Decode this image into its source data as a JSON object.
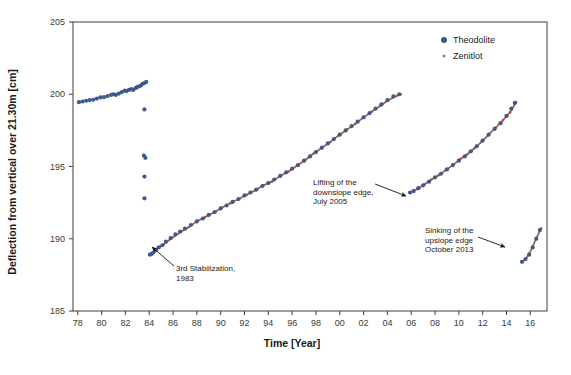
{
  "figure": {
    "background": "#ffffff",
    "frame_color": "#3f3f3f"
  },
  "chart_data": {
    "type": "scatter",
    "title": "",
    "xlabel": "Time [Year]",
    "ylabel": "Deflection from vertical over 21.30m [cm]",
    "xlim": [
      78,
      17
    ],
    "ylim": [
      185,
      205
    ],
    "grid": false,
    "legend_position": "top-right",
    "x_ticks": [
      "78",
      "80",
      "82",
      "84",
      "86",
      "88",
      "90",
      "92",
      "94",
      "96",
      "98",
      "00",
      "02",
      "04",
      "06",
      "08",
      "10",
      "12",
      "14",
      "16"
    ],
    "x_tick_values": [
      78,
      80,
      82,
      84,
      86,
      88,
      90,
      92,
      94,
      96,
      98,
      100,
      102,
      104,
      106,
      108,
      110,
      112,
      114,
      116
    ],
    "y_ticks": [
      "185",
      "190",
      "195",
      "200",
      "205"
    ],
    "y_tick_values": [
      185,
      190,
      195,
      200,
      205
    ],
    "series": [
      {
        "name": "Theodolite",
        "color": "#3d5a8c",
        "marker": "circle",
        "points": [
          [
            78.1,
            199.45
          ],
          [
            78.4,
            199.5
          ],
          [
            78.7,
            199.55
          ],
          [
            79.0,
            199.6
          ],
          [
            79.3,
            199.62
          ],
          [
            79.6,
            199.7
          ],
          [
            79.9,
            199.78
          ],
          [
            80.2,
            199.8
          ],
          [
            80.5,
            199.88
          ],
          [
            80.8,
            199.95
          ],
          [
            81.0,
            200.0
          ],
          [
            81.2,
            199.95
          ],
          [
            81.45,
            200.05
          ],
          [
            81.7,
            200.15
          ],
          [
            81.95,
            200.25
          ],
          [
            82.1,
            200.22
          ],
          [
            82.3,
            200.3
          ],
          [
            82.5,
            200.35
          ],
          [
            82.65,
            200.3
          ],
          [
            82.85,
            200.42
          ],
          [
            83.0,
            200.5
          ],
          [
            83.15,
            200.55
          ],
          [
            83.3,
            200.6
          ],
          [
            83.45,
            200.72
          ],
          [
            83.6,
            200.78
          ],
          [
            83.75,
            200.85
          ],
          [
            83.6,
            198.95
          ],
          [
            83.55,
            195.75
          ],
          [
            83.68,
            195.6
          ],
          [
            83.6,
            194.3
          ],
          [
            83.6,
            192.8
          ],
          [
            84.05,
            188.9
          ],
          [
            84.2,
            188.95
          ],
          [
            84.35,
            189.05
          ],
          [
            84.55,
            189.2
          ],
          [
            84.8,
            189.4
          ],
          [
            85.1,
            189.55
          ],
          [
            85.4,
            189.8
          ],
          [
            85.8,
            190.05
          ],
          [
            86.2,
            190.3
          ],
          [
            86.6,
            190.5
          ],
          [
            87.0,
            190.7
          ],
          [
            87.5,
            190.95
          ],
          [
            88.0,
            191.2
          ],
          [
            88.5,
            191.4
          ],
          [
            89.0,
            191.65
          ],
          [
            89.5,
            191.85
          ],
          [
            90.0,
            192.1
          ],
          [
            90.5,
            192.3
          ],
          [
            91.0,
            192.55
          ],
          [
            91.5,
            192.75
          ],
          [
            92.0,
            193.0
          ],
          [
            92.5,
            193.2
          ],
          [
            93.0,
            193.4
          ],
          [
            93.5,
            193.65
          ],
          [
            94.0,
            193.85
          ],
          [
            94.5,
            194.1
          ],
          [
            95.0,
            194.35
          ],
          [
            95.5,
            194.6
          ],
          [
            96.0,
            194.85
          ],
          [
            96.5,
            195.1
          ],
          [
            97.0,
            195.4
          ],
          [
            97.5,
            195.7
          ],
          [
            98.0,
            196.0
          ],
          [
            98.5,
            196.3
          ],
          [
            99.0,
            196.6
          ],
          [
            99.5,
            196.9
          ],
          [
            100.0,
            197.2
          ],
          [
            100.5,
            197.5
          ],
          [
            101.0,
            197.8
          ],
          [
            101.5,
            198.1
          ],
          [
            102.0,
            198.4
          ],
          [
            102.5,
            198.7
          ],
          [
            103.0,
            199.0
          ],
          [
            103.5,
            199.3
          ],
          [
            104.0,
            199.6
          ],
          [
            104.5,
            199.85
          ],
          [
            105.0,
            200.0
          ],
          [
            105.9,
            193.2
          ],
          [
            106.2,
            193.3
          ],
          [
            106.6,
            193.5
          ],
          [
            107.0,
            193.7
          ],
          [
            107.5,
            193.95
          ],
          [
            108.0,
            194.25
          ],
          [
            108.5,
            194.5
          ],
          [
            109.0,
            194.8
          ],
          [
            109.5,
            195.1
          ],
          [
            110.0,
            195.4
          ],
          [
            110.5,
            195.7
          ],
          [
            111.0,
            196.05
          ],
          [
            111.5,
            196.4
          ],
          [
            112.0,
            196.8
          ],
          [
            112.5,
            197.2
          ],
          [
            113.0,
            197.6
          ],
          [
            113.5,
            198.0
          ],
          [
            114.0,
            198.5
          ],
          [
            114.4,
            199.0
          ],
          [
            114.7,
            199.4
          ],
          [
            115.3,
            188.4
          ],
          [
            115.6,
            188.6
          ],
          [
            115.9,
            188.9
          ],
          [
            116.2,
            189.4
          ],
          [
            116.5,
            190.0
          ],
          [
            116.8,
            190.6
          ]
        ]
      },
      {
        "name": "Zenitlot",
        "color": "#a8583f",
        "marker": "dot",
        "segments": [
          {
            "from": 84.0,
            "to": 105.1,
            "points": [
              [
                84.05,
                188.9
              ],
              [
                84.6,
                189.25
              ],
              [
                85.2,
                189.6
              ],
              [
                85.9,
                190.05
              ],
              [
                86.6,
                190.45
              ],
              [
                87.3,
                190.8
              ],
              [
                88.0,
                191.2
              ],
              [
                88.7,
                191.5
              ],
              [
                89.4,
                191.8
              ],
              [
                90.1,
                192.15
              ],
              [
                90.8,
                192.45
              ],
              [
                91.5,
                192.75
              ],
              [
                92.2,
                193.05
              ],
              [
                92.9,
                193.35
              ],
              [
                93.6,
                193.7
              ],
              [
                94.3,
                193.95
              ],
              [
                95.0,
                194.35
              ],
              [
                95.7,
                194.65
              ],
              [
                96.4,
                195.05
              ],
              [
                97.1,
                195.45
              ],
              [
                97.8,
                195.9
              ],
              [
                98.5,
                196.3
              ],
              [
                99.2,
                196.7
              ],
              [
                99.9,
                197.15
              ],
              [
                100.6,
                197.55
              ],
              [
                101.3,
                197.95
              ],
              [
                102.0,
                198.4
              ],
              [
                102.7,
                198.8
              ],
              [
                103.4,
                199.2
              ],
              [
                104.1,
                199.6
              ],
              [
                104.8,
                199.9
              ],
              [
                105.1,
                200.0
              ]
            ]
          },
          {
            "from": 105.9,
            "to": 114.8,
            "points": [
              [
                105.9,
                193.2
              ],
              [
                106.5,
                193.45
              ],
              [
                107.1,
                193.75
              ],
              [
                107.7,
                194.1
              ],
              [
                108.3,
                194.4
              ],
              [
                108.9,
                194.75
              ],
              [
                109.5,
                195.1
              ],
              [
                110.1,
                195.5
              ],
              [
                110.7,
                195.85
              ],
              [
                111.3,
                196.25
              ],
              [
                111.9,
                196.7
              ],
              [
                112.5,
                197.2
              ],
              [
                113.1,
                197.7
              ],
              [
                113.7,
                198.2
              ],
              [
                114.3,
                198.75
              ],
              [
                114.8,
                199.45
              ]
            ]
          },
          {
            "from": 115.3,
            "to": 116.9,
            "points": [
              [
                115.3,
                188.4
              ],
              [
                115.6,
                188.6
              ],
              [
                115.9,
                188.95
              ],
              [
                116.2,
                189.45
              ],
              [
                116.5,
                190.05
              ],
              [
                116.9,
                190.7
              ]
            ]
          }
        ]
      }
    ],
    "annotations": [
      {
        "id": "annot-3rd-stabilization",
        "lines": [
          "3rd Stabilization,",
          "1983"
        ],
        "text_x": 176,
        "text_y": 271,
        "arrow_from": [
          174,
          266
        ],
        "arrow_to": [
          152,
          247
        ]
      },
      {
        "id": "annot-lifting-downslope",
        "lines": [
          "Lifting of the",
          "downslope edge,",
          "July 2005"
        ],
        "text_x": 313,
        "text_y": 185,
        "arrow_from": [
          375,
          184
        ],
        "arrow_to": [
          406,
          196
        ]
      },
      {
        "id": "annot-sinking-upslope",
        "lines": [
          "Sinking of the",
          "upslope edge",
          "October 2013"
        ],
        "text_x": 425,
        "text_y": 233,
        "arrow_from": [
          478,
          237
        ],
        "arrow_to": [
          505,
          247
        ]
      }
    ],
    "legend": [
      {
        "label": "Theodolite",
        "color": "#3d5a8c",
        "size": 3
      },
      {
        "label": "Zenitlot",
        "color": "#8a8a8a",
        "size": 1.6
      }
    ]
  },
  "caption": {
    "text": ""
  }
}
